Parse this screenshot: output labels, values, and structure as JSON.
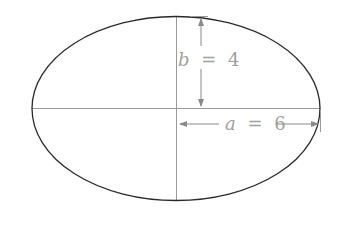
{
  "diagram": {
    "type": "ellipse",
    "colors": {
      "outline": "#2a2a2a",
      "axes": "#9a9a9a",
      "annotation": "#a0a0a0",
      "background": "#ffffff"
    },
    "semi_minor": {
      "variable": "b",
      "equals": "=",
      "value": "4"
    },
    "semi_major": {
      "variable": "a",
      "equals": "=",
      "value": "6"
    }
  }
}
